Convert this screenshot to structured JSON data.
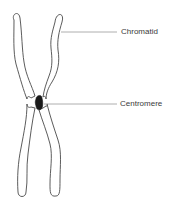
{
  "diagram": {
    "labels": {
      "chromatid": "Chromatid",
      "centromere": "Centromere"
    },
    "colors": {
      "outline": "#4a4a4a",
      "leader_line": "#9a9a9a",
      "centromere_fill": "#1a1a1a",
      "text": "#3a3a3a",
      "background": "#ffffff"
    }
  }
}
